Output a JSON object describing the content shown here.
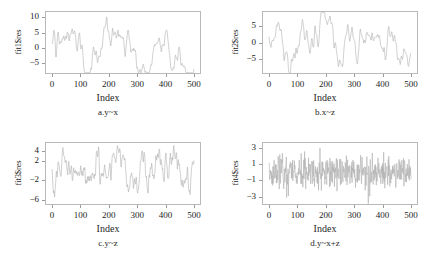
{
  "figure": {
    "layout": "2x2 grid of residual time-series plots",
    "panels": [
      "a",
      "b",
      "c",
      "d"
    ]
  },
  "chart_data": [
    {
      "type": "line",
      "panel": "a",
      "title": "a.y~x",
      "caption": "a.y~x",
      "xlabel": "Index",
      "ylabel": "fit1$res",
      "xlim": [
        0,
        500
      ],
      "ylim": [
        -8.2,
        11.8
      ],
      "xticks": [
        0,
        100,
        200,
        300,
        400,
        500
      ],
      "yticks": [
        10,
        5,
        0,
        -5
      ],
      "grid": false,
      "legend": "none",
      "line_color": "#b0b0b0",
      "series_description": "Autocorrelated residuals: wanders from about -3 up to a peak near +11 around index 165, back down to a trough near -7 around index 350, rising again toward +5 near index 480",
      "n_points": 500,
      "generator": {
        "kind": "ar1_smoothed",
        "seed": 101,
        "phi": 0.965,
        "sigma": 1.05,
        "scale": 5.2,
        "offset": -1.0,
        "smooth": 2
      }
    },
    {
      "type": "line",
      "panel": "b",
      "title": "b.x~z",
      "caption": "b.x~z",
      "xlabel": "Index",
      "ylabel": "fit2$res",
      "xlim": [
        0,
        500
      ],
      "ylim": [
        -9.5,
        9.5
      ],
      "xticks": [
        0,
        100,
        200,
        300,
        400,
        500
      ],
      "yticks": [
        5,
        0,
        -5
      ],
      "grid": false,
      "legend": "none",
      "line_color": "#b0b0b0",
      "series_description": "Autocorrelated residuals oscillating between about -8 and +8, peaks near index 60 and 270, troughs near index 165 and 430",
      "n_points": 500,
      "generator": {
        "kind": "ar1_smoothed",
        "seed": 202,
        "phi": 0.93,
        "sigma": 1.2,
        "scale": 4.3,
        "offset": 0.2,
        "smooth": 2
      }
    },
    {
      "type": "line",
      "panel": "c",
      "title": "c.y~z",
      "caption": "c.y~z",
      "xlabel": "Index",
      "ylabel": "fit3$res",
      "xlim": [
        0,
        500
      ],
      "ylim": [
        -6.8,
        5.6
      ],
      "xticks": [
        0,
        100,
        200,
        300,
        400,
        500
      ],
      "yticks": [
        4,
        2,
        -2,
        -6
      ],
      "grid": false,
      "legend": "none",
      "line_color": "#b0b0b0",
      "series_description": "Moderately autocorrelated residuals mostly between -4 and +4, high near index 60 and 280, dips near index 210 and 430",
      "n_points": 500,
      "generator": {
        "kind": "ar1_smoothed",
        "seed": 303,
        "phi": 0.88,
        "sigma": 1.1,
        "scale": 2.3,
        "offset": 0.1,
        "smooth": 1
      }
    },
    {
      "type": "line",
      "panel": "d",
      "title": "d.y~x+z",
      "caption": "d.y~x+z",
      "xlabel": "Index",
      "ylabel": "fit4$res",
      "xlim": [
        0,
        500
      ],
      "ylim": [
        -3.9,
        3.6
      ],
      "xticks": [
        0,
        100,
        200,
        300,
        400,
        500
      ],
      "yticks": [
        3,
        1,
        -1,
        -3
      ],
      "grid": false,
      "legend": "none",
      "line_color": "#b0b0b0",
      "series_description": "White-noise residuals centred on 0, spanning roughly -3.5 to +3, no visible trend or autocorrelation",
      "n_points": 500,
      "generator": {
        "kind": "white_noise",
        "seed": 404,
        "phi": 0.0,
        "sigma": 1.0,
        "scale": 1.0,
        "offset": 0.0,
        "smooth": 0
      }
    }
  ]
}
